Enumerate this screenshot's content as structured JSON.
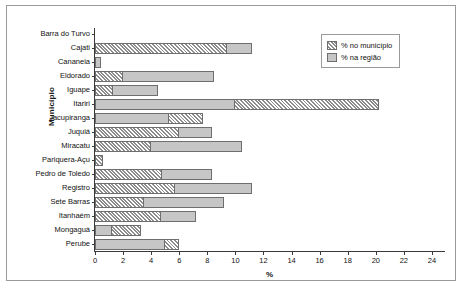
{
  "chart_data": {
    "type": "bar",
    "orientation": "horizontal",
    "title": "",
    "xlabel": "%",
    "ylabel": "Município",
    "xlim": [
      0,
      25
    ],
    "xticks": [
      0,
      2,
      4,
      6,
      8,
      10,
      12,
      14,
      16,
      18,
      20,
      22,
      24
    ],
    "grid": false,
    "legend_position": "top-right",
    "categories": [
      "Barra do Turvo",
      "Cajati",
      "Cananeia",
      "Eldorado",
      "Iguape",
      "Itariri",
      "Jacupiranga",
      "Juquiá",
      "Miracatu",
      "Pariquera-Açu",
      "Pedro de Toledo",
      "Registro",
      "Sete Barras",
      "Itanhaém",
      "Mongaguá",
      "Perube"
    ],
    "series": [
      {
        "name": "% no município",
        "style": "hatched",
        "color": "#8d8d8d",
        "values": [
          0,
          9.4,
          0,
          2.0,
          1.3,
          20.2,
          7.7,
          6.0,
          4.0,
          0.6,
          4.8,
          5.7,
          3.5,
          4.7,
          3.3,
          6.0
        ]
      },
      {
        "name": "% na região",
        "style": "solid",
        "color": "#c6c6c6",
        "values": [
          0,
          11.2,
          0.4,
          8.5,
          4.5,
          10.0,
          5.3,
          8.3,
          10.5,
          0,
          8.3,
          11.2,
          9.2,
          7.2,
          1.2,
          5.0
        ]
      }
    ]
  },
  "legend": {
    "items": [
      {
        "label": "% no município",
        "style": "hatch"
      },
      {
        "label": "% na região",
        "style": "solid"
      }
    ]
  },
  "axes": {
    "y_title": "Município",
    "x_title": "%"
  }
}
